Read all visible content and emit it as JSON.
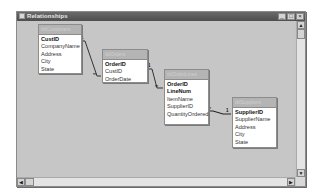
{
  "window": {
    "title": "Relationships",
    "controls": {
      "minimize": "_",
      "maximize": "□",
      "close": "×"
    }
  },
  "tables": [
    {
      "name": "tblCustomers",
      "fields": [
        {
          "label": "CustID",
          "pk": true
        },
        {
          "label": "CompanyName",
          "pk": false
        },
        {
          "label": "Address",
          "pk": false
        },
        {
          "label": "City",
          "pk": false
        },
        {
          "label": "State",
          "pk": false
        }
      ]
    },
    {
      "name": "tblOrders",
      "fields": [
        {
          "label": "OrderID",
          "pk": true
        },
        {
          "label": "CustID",
          "pk": false
        },
        {
          "label": "OrderDate",
          "pk": false
        }
      ]
    },
    {
      "name": "tblOrderLines",
      "fields": [
        {
          "label": "OrderID",
          "pk": true
        },
        {
          "label": "LineNum",
          "pk": true
        },
        {
          "label": "ItemName",
          "pk": false
        },
        {
          "label": "SupplierID",
          "pk": false
        },
        {
          "label": "QuantityOrdered",
          "pk": false
        }
      ]
    },
    {
      "name": "tblSuppliers",
      "fields": [
        {
          "label": "SupplierID",
          "pk": true
        },
        {
          "label": "SupplierName",
          "pk": false
        },
        {
          "label": "Address",
          "pk": false
        },
        {
          "label": "City",
          "pk": false
        },
        {
          "label": "State",
          "pk": false
        }
      ]
    }
  ],
  "relationships": [
    {
      "from": "tblCustomers.CustID",
      "to": "tblOrders.CustID",
      "one": "1",
      "many": "∞"
    },
    {
      "from": "tblOrders.OrderID",
      "to": "tblOrderLines.OrderID",
      "one": "1",
      "many": "∞"
    },
    {
      "from": "tblSuppliers.SupplierID",
      "to": "tblOrderLines.SupplierID",
      "one": "1",
      "many": "∞"
    }
  ],
  "scrollbars": {
    "up": "▲",
    "down": "▼",
    "left": "◀",
    "right": "▶"
  }
}
